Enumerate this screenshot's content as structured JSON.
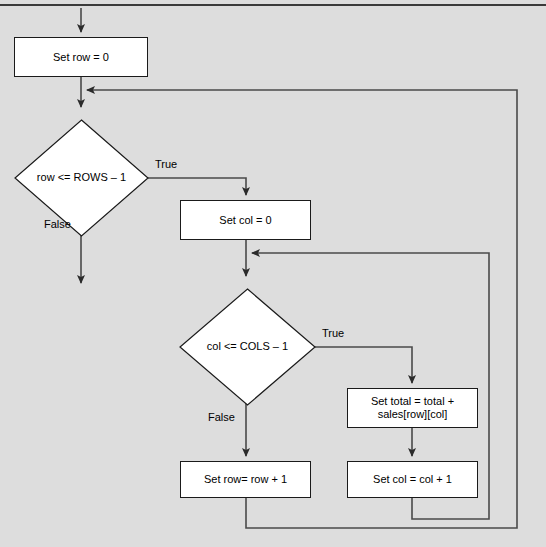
{
  "canvas": {
    "width": 546,
    "height": 547,
    "background_color": "#dddddd",
    "line_color": "#3d3d3d",
    "node_fill": "#ffffff",
    "node_border": "#1a1a1a",
    "text_color": "#000000"
  },
  "diagram": {
    "type": "flowchart",
    "nodes": [
      {
        "id": "set-row-0",
        "shape": "process",
        "label": "Set row = 0",
        "x": 14,
        "y": 37,
        "w": 134,
        "h": 40
      },
      {
        "id": "row-condition",
        "shape": "decision",
        "label": "row <= ROWS – 1",
        "x": 15,
        "y": 112,
        "w": 133,
        "h": 116
      },
      {
        "id": "set-col-0",
        "shape": "process",
        "label": "Set col = 0",
        "x": 180,
        "y": 200,
        "w": 131,
        "h": 40
      },
      {
        "id": "col-condition",
        "shape": "decision",
        "label": "col <= COLS – 1",
        "x": 180,
        "y": 281,
        "w": 135,
        "h": 116
      },
      {
        "id": "set-total",
        "shape": "process",
        "label": "Set total = total +\nsales[row][col]",
        "x": 347,
        "y": 388,
        "w": 131,
        "h": 40
      },
      {
        "id": "set-row-increment",
        "shape": "process",
        "label": "Set row= row + 1",
        "x": 180,
        "y": 461,
        "w": 131,
        "h": 37
      },
      {
        "id": "set-col-increment",
        "shape": "process",
        "label": "Set col = col + 1",
        "x": 347,
        "y": 461,
        "w": 131,
        "h": 37
      }
    ],
    "edge_labels": [
      {
        "id": "row-true",
        "text": "True",
        "x": 155,
        "y": 158
      },
      {
        "id": "row-false",
        "text": "False",
        "x": 44,
        "y": 218
      },
      {
        "id": "col-true",
        "text": "True",
        "x": 322,
        "y": 327
      },
      {
        "id": "col-false",
        "text": "False",
        "x": 208,
        "y": 411
      }
    ],
    "edges": [
      {
        "id": "entry-to-set-row",
        "from": "start",
        "to": "set-row-0",
        "arrow": true
      },
      {
        "id": "set-row-to-row-condition",
        "from": "set-row-0",
        "to": "row-condition",
        "arrow": true
      },
      {
        "id": "row-condition-true",
        "from": "row-condition",
        "to": "set-col-0",
        "arrow": true,
        "label": "True"
      },
      {
        "id": "row-condition-false",
        "from": "row-condition",
        "to": "exit",
        "arrow": true,
        "label": "False"
      },
      {
        "id": "set-col-to-col-condition",
        "from": "set-col-0",
        "to": "col-condition",
        "arrow": true
      },
      {
        "id": "col-condition-true",
        "from": "col-condition",
        "to": "set-total",
        "arrow": true,
        "label": "True"
      },
      {
        "id": "col-condition-false",
        "from": "col-condition",
        "to": "set-row-increment",
        "arrow": true,
        "label": "False"
      },
      {
        "id": "set-total-to-col-increment",
        "from": "set-total",
        "to": "set-col-increment",
        "arrow": true
      },
      {
        "id": "inner-loop-back",
        "from": "set-col-increment",
        "to": "col-condition",
        "arrow": true
      },
      {
        "id": "outer-loop-back",
        "from": "set-row-increment",
        "to": "row-condition",
        "arrow": true
      }
    ]
  }
}
